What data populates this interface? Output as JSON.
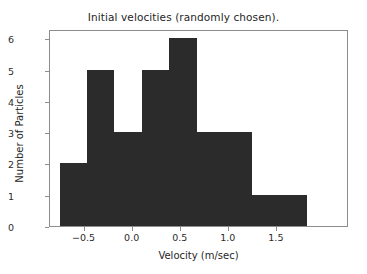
{
  "chart_data": {
    "type": "bar",
    "title": "Initial velocities (randomly chosen).",
    "xlabel": "Velocity (m/sec)",
    "ylabel": "Number of Particles",
    "grid": false,
    "legend": null,
    "bar_color": "#2b2b2b",
    "axes_color": "#8d8d8d",
    "xlim": [
      -0.86,
      2.25
    ],
    "ylim": [
      0,
      6.3
    ],
    "xticks": [
      -0.5,
      0.0,
      0.5,
      1.0,
      1.5
    ],
    "xtick_labels": [
      "−0.5",
      "0.0",
      "0.5",
      "1.0",
      "1.5"
    ],
    "yticks": [
      0,
      1,
      2,
      3,
      4,
      5,
      6
    ],
    "ytick_labels": [
      "0",
      "1",
      "2",
      "3",
      "4",
      "5",
      "6"
    ],
    "bin_edges": [
      -0.76,
      -0.47,
      -0.19,
      0.1,
      0.38,
      0.67,
      0.95,
      1.24,
      1.52,
      1.81
    ],
    "values": [
      2,
      5,
      3,
      5,
      6,
      3,
      3,
      1,
      1
    ],
    "categories": [
      "-0.76 to -0.47",
      "-0.47 to -0.19",
      "-0.19 to 0.10",
      "0.10 to 0.38",
      "0.38 to 0.67",
      "0.67 to 0.95",
      "0.95 to 1.24",
      "1.24 to 1.52",
      "1.52 to 1.81"
    ]
  }
}
